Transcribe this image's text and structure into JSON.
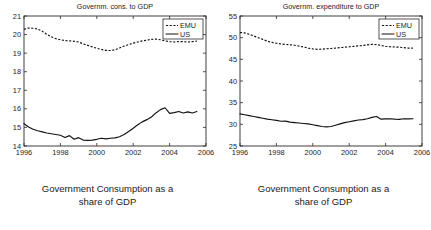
{
  "figure": {
    "panels": [
      {
        "id": "left",
        "caption_line1": "Government Consumption as a",
        "caption_line2": "share of GDP",
        "chart_data": {
          "type": "line",
          "title": "Governm. cons. to GDP",
          "xlabel": "",
          "ylabel": "",
          "xlim": [
            1996,
            2006
          ],
          "ylim": [
            14,
            21
          ],
          "xticks": [
            1996,
            1998,
            2000,
            2002,
            2004,
            2006
          ],
          "yticks": [
            14,
            15,
            16,
            17,
            18,
            19,
            20,
            21
          ],
          "grid": false,
          "legend_position": "upper-right",
          "x": [
            1996,
            1996.25,
            1996.5,
            1996.75,
            1997,
            1997.25,
            1997.5,
            1997.75,
            1998,
            1998.25,
            1998.5,
            1998.75,
            1999,
            1999.25,
            1999.5,
            1999.75,
            2000,
            2000.25,
            2000.5,
            2000.75,
            2001,
            2001.25,
            2001.5,
            2001.75,
            2002,
            2002.25,
            2002.5,
            2002.75,
            2003,
            2003.25,
            2003.5,
            2003.75,
            2004,
            2004.25,
            2004.5,
            2004.75,
            2005,
            2005.25,
            2005.5
          ],
          "series": [
            {
              "name": "EMU",
              "style": "dashed",
              "values": [
                20.28,
                20.35,
                20.34,
                20.3,
                20.18,
                20.02,
                19.88,
                19.78,
                19.72,
                19.68,
                19.66,
                19.64,
                19.6,
                19.5,
                19.42,
                19.34,
                19.26,
                19.2,
                19.15,
                19.14,
                19.18,
                19.28,
                19.38,
                19.46,
                19.54,
                19.6,
                19.66,
                19.7,
                19.74,
                19.76,
                19.72,
                19.66,
                19.62,
                19.6,
                19.62,
                19.62,
                19.6,
                19.62,
                19.65
              ]
            },
            {
              "name": "US",
              "style": "solid",
              "values": [
                15.2,
                15.02,
                14.9,
                14.82,
                14.76,
                14.7,
                14.66,
                14.62,
                14.58,
                14.46,
                14.56,
                14.36,
                14.45,
                14.32,
                14.3,
                14.32,
                14.36,
                14.42,
                14.38,
                14.42,
                14.44,
                14.5,
                14.62,
                14.78,
                14.96,
                15.14,
                15.3,
                15.42,
                15.56,
                15.78,
                15.96,
                16.06,
                15.76,
                15.8,
                15.86,
                15.78,
                15.84,
                15.78,
                15.86
              ]
            }
          ]
        }
      },
      {
        "id": "right",
        "caption_line1": "Government Consumption as a",
        "caption_line2": "share of GDP",
        "chart_data": {
          "type": "line",
          "title": "Governm. expenditure to GDP",
          "xlabel": "",
          "ylabel": "",
          "xlim": [
            1996,
            2006
          ],
          "ylim": [
            25,
            55
          ],
          "xticks": [
            1996,
            1998,
            2000,
            2002,
            2004,
            2006
          ],
          "yticks": [
            25,
            30,
            35,
            40,
            45,
            50,
            55
          ],
          "grid": false,
          "legend_position": "upper-right",
          "x": [
            1996,
            1996.25,
            1996.5,
            1996.75,
            1997,
            1997.25,
            1997.5,
            1997.75,
            1998,
            1998.25,
            1998.5,
            1998.75,
            1999,
            1999.25,
            1999.5,
            1999.75,
            2000,
            2000.25,
            2000.5,
            2000.75,
            2001,
            2001.25,
            2001.5,
            2001.75,
            2002,
            2002.25,
            2002.5,
            2002.75,
            2003,
            2003.25,
            2003.5,
            2003.75,
            2004,
            2004.25,
            2004.5,
            2004.75,
            2005,
            2005.25,
            2005.5
          ],
          "series": [
            {
              "name": "EMU",
              "style": "dashed",
              "values": [
                51.2,
                51.1,
                50.8,
                50.4,
                50.0,
                49.6,
                49.2,
                48.9,
                48.7,
                48.55,
                48.45,
                48.35,
                48.25,
                48.05,
                47.85,
                47.6,
                47.4,
                47.3,
                47.35,
                47.45,
                47.5,
                47.6,
                47.7,
                47.8,
                47.9,
                48.0,
                48.1,
                48.2,
                48.35,
                48.45,
                48.4,
                48.2,
                48.0,
                47.9,
                47.85,
                47.8,
                47.7,
                47.6,
                47.6
              ]
            },
            {
              "name": "US",
              "style": "solid",
              "values": [
                32.4,
                32.2,
                32.0,
                31.8,
                31.6,
                31.4,
                31.2,
                31.05,
                30.9,
                30.7,
                30.75,
                30.5,
                30.4,
                30.3,
                30.2,
                30.1,
                29.9,
                29.7,
                29.5,
                29.4,
                29.5,
                29.8,
                30.1,
                30.4,
                30.6,
                30.8,
                31.0,
                31.1,
                31.3,
                31.6,
                31.8,
                31.2,
                31.25,
                31.3,
                31.2,
                31.15,
                31.3,
                31.25,
                31.3
              ]
            }
          ]
        }
      }
    ]
  }
}
